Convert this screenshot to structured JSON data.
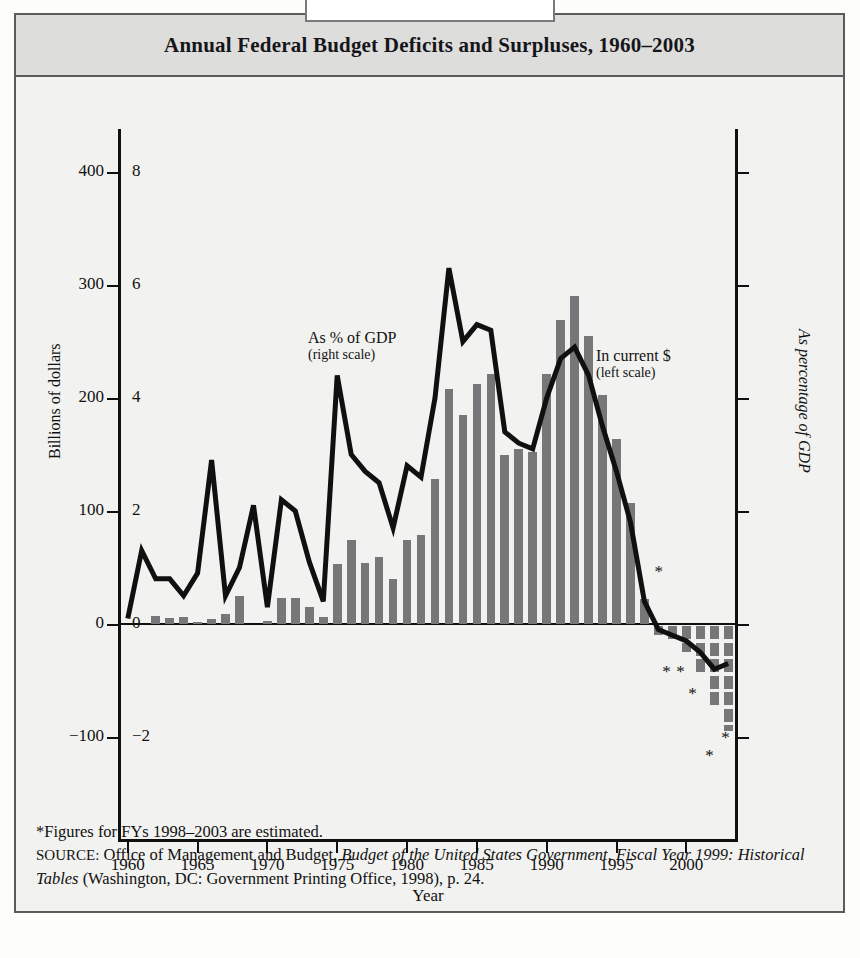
{
  "title": "Annual Federal Budget Deficits and Surpluses, 1960–2003",
  "axes": {
    "left_label": "Billions of dollars",
    "right_label": "As percentage of GDP",
    "x_label": "Year",
    "left_ticks": [
      "400",
      "300",
      "200",
      "100",
      "0",
      "−100"
    ],
    "right_ticks": [
      "8",
      "6",
      "4",
      "2",
      "0",
      "−2"
    ],
    "x_ticks": [
      "1960",
      "1965",
      "1970",
      "1975",
      "1980",
      "1985",
      "1990",
      "1995",
      "2000"
    ]
  },
  "annotations": {
    "line_series": "As % of GDP",
    "line_series_sub": "(right scale)",
    "bar_series": "In current $",
    "bar_series_sub": "(left scale)",
    "star_glyph": "*"
  },
  "notes": {
    "footnote": "*Figures for FYs 1998–2003 are estimated.",
    "source_prefix": "SOURCE:",
    "source_text_1": " Office of Management and Budget, ",
    "source_italic_1": "Budget of the United States Government, Fiscal Year 1999: Historical Tables",
    "source_text_2": " (Washington, DC: Government Printing Office, 1998), p. 24."
  },
  "colors": {
    "bar_fill": "#77777a",
    "line_stroke": "#101010",
    "title_band": "#dddddb",
    "panel_bg": "#f2f2f0",
    "frame": "#5b5b5b"
  },
  "chart_data": {
    "type": "bar",
    "title": "Annual Federal Budget Deficits and Surpluses, 1960–2003",
    "xlabel": "Year",
    "ylabel": "Billions of dollars",
    "y2label": "As percentage of GDP",
    "ylim": [
      -130,
      440
    ],
    "y2lim": [
      -2.6,
      8.8
    ],
    "xlim": [
      1959.3,
      2003.7
    ],
    "grid": false,
    "legend": "in-plot annotations",
    "note": "Bars = deficit (+) / surplus (−) in current dollars, left scale. Line = deficit as % of GDP, right scale. Values for FY1998–2003 are estimates.",
    "categories": [
      1960,
      1961,
      1962,
      1963,
      1964,
      1965,
      1966,
      1967,
      1968,
      1969,
      1970,
      1971,
      1972,
      1973,
      1974,
      1975,
      1976,
      1977,
      1978,
      1979,
      1980,
      1981,
      1982,
      1983,
      1984,
      1985,
      1986,
      1987,
      1988,
      1989,
      1990,
      1991,
      1992,
      1993,
      1994,
      1995,
      1996,
      1997,
      1998,
      1999,
      2000,
      2001,
      2002,
      2003
    ],
    "series": [
      {
        "name": "In current $",
        "type": "bar",
        "axis": "left",
        "unit": "billions of dollars",
        "values": [
          0,
          -3,
          7,
          5,
          6,
          1,
          4,
          9,
          25,
          -3,
          3,
          23,
          23,
          15,
          6,
          53,
          74,
          54,
          59,
          40,
          74,
          79,
          128,
          208,
          185,
          212,
          221,
          150,
          155,
          152,
          221,
          269,
          290,
          255,
          203,
          164,
          107,
          22,
          -10,
          -20,
          -25,
          -48,
          -80,
          -95
        ]
      },
      {
        "name": "As % of GDP",
        "type": "line",
        "axis": "right",
        "unit": "percent of GDP",
        "values": [
          0.1,
          1.3,
          0.8,
          0.8,
          0.5,
          0.9,
          2.9,
          0.5,
          1.0,
          2.1,
          0.3,
          2.2,
          2.0,
          1.1,
          0.4,
          4.4,
          3.0,
          2.7,
          2.5,
          1.7,
          2.8,
          2.6,
          4.0,
          6.3,
          5.0,
          5.3,
          5.2,
          3.4,
          3.2,
          3.1,
          4.0,
          4.7,
          4.9,
          4.4,
          3.5,
          2.7,
          1.8,
          0.4,
          -0.1,
          -0.2,
          -0.3,
          -0.5,
          -0.8,
          -0.7
        ]
      }
    ]
  }
}
